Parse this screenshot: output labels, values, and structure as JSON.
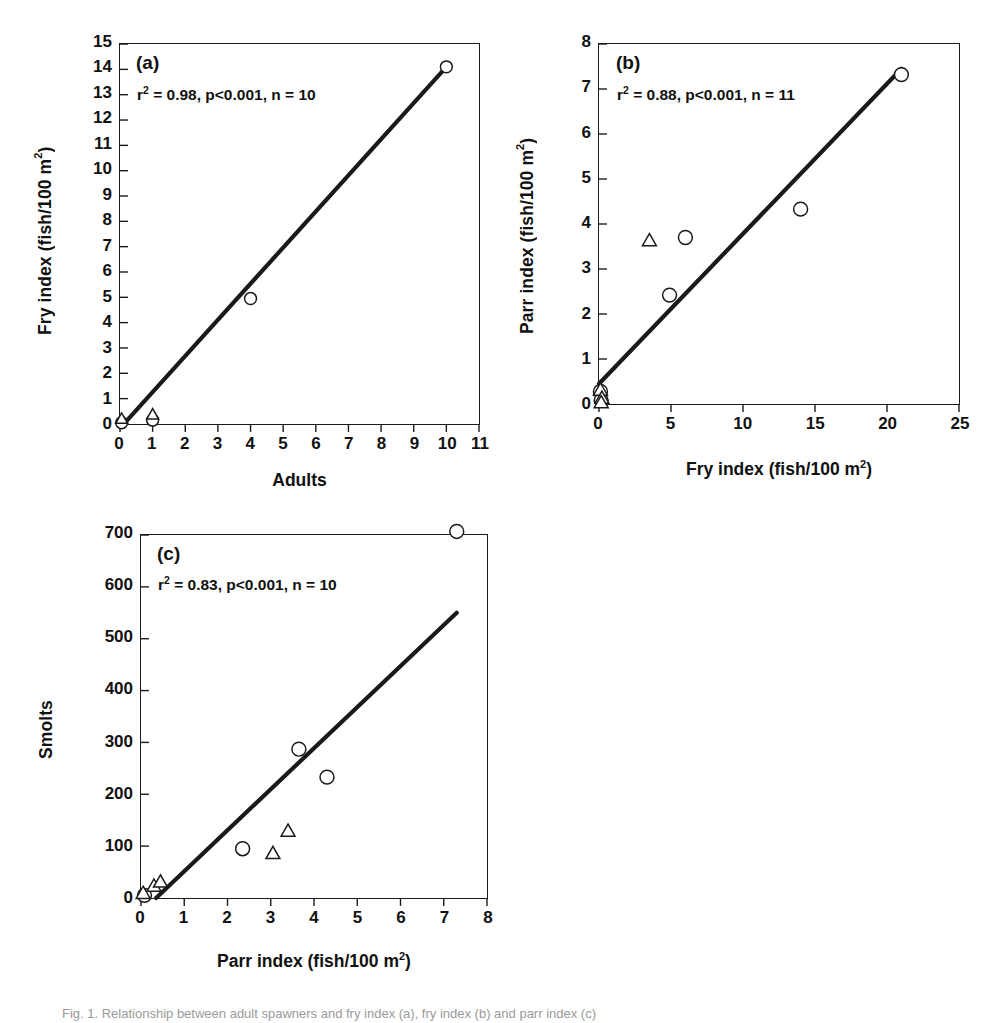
{
  "figure": {
    "background": "#ffffff",
    "ink": "#1a1a1a",
    "caption_fragment": "Fig. 1. Relationship between adult spawners and fry index (a), fry index (b) and parr index (c)"
  },
  "chart_data": [
    {
      "id": "panel-a",
      "type": "scatter",
      "panel_label": "(a)",
      "annotation": "r² = 0.98, p<0.001, n = 10",
      "stats": {
        "r2": 0.98,
        "p": "p<0.001",
        "n": 10
      },
      "xlabel": "Adults",
      "ylabel": "Fry index (fish/100 m²)",
      "xlim": [
        0,
        11
      ],
      "ylim": [
        0,
        15
      ],
      "xticks": [
        0,
        1,
        2,
        3,
        4,
        5,
        6,
        7,
        8,
        9,
        10,
        11
      ],
      "yticks": [
        0,
        1,
        2,
        3,
        4,
        5,
        6,
        7,
        8,
        9,
        10,
        11,
        12,
        13,
        14,
        15
      ],
      "grid": false,
      "legend": null,
      "series": [
        {
          "name": "circles",
          "marker": "open-circle",
          "points": [
            [
              0.05,
              0.05
            ],
            [
              1.0,
              0.15
            ],
            [
              4.0,
              4.95
            ],
            [
              10.0,
              14.1
            ]
          ]
        },
        {
          "name": "triangles",
          "marker": "open-triangle",
          "points": [
            [
              0.05,
              0.18
            ],
            [
              1.0,
              0.35
            ]
          ]
        }
      ],
      "fit_line": {
        "x": [
          0.12,
          10.0
        ],
        "y": [
          0.0,
          14.1
        ]
      }
    },
    {
      "id": "panel-b",
      "type": "scatter",
      "panel_label": "(b)",
      "annotation": "r² = 0.88, p<0.001, n = 11",
      "stats": {
        "r2": 0.88,
        "p": "p<0.001",
        "n": 11
      },
      "xlabel": "Fry index (fish/100 m²)",
      "ylabel": "Parr index (fish/100 m²)",
      "xlim": [
        0,
        25
      ],
      "ylim": [
        0,
        8
      ],
      "xticks": [
        0,
        5,
        10,
        15,
        20,
        25
      ],
      "yticks": [
        0,
        1,
        2,
        3,
        4,
        5,
        6,
        7,
        8
      ],
      "grid": false,
      "legend": null,
      "series": [
        {
          "name": "circles",
          "marker": "open-circle",
          "points": [
            [
              0.1,
              0.28
            ],
            [
              0.15,
              0.08
            ],
            [
              4.9,
              2.42
            ],
            [
              6.0,
              3.7
            ],
            [
              14.0,
              4.33
            ],
            [
              21.0,
              7.32
            ]
          ]
        },
        {
          "name": "triangles",
          "marker": "open-triangle",
          "points": [
            [
              0.1,
              0.3
            ],
            [
              0.2,
              0.12
            ],
            [
              0.15,
              0.02
            ],
            [
              3.5,
              3.62
            ]
          ]
        }
      ],
      "fit_line": {
        "x": [
          0.0,
          21.0
        ],
        "y": [
          0.45,
          7.45
        ]
      }
    },
    {
      "id": "panel-c",
      "type": "scatter",
      "panel_label": "(c)",
      "annotation": "r² = 0.83, p<0.001, n = 10",
      "stats": {
        "r2": 0.83,
        "p": "p<0.001",
        "n": 10
      },
      "xlabel": "Parr index (fish/100 m²)",
      "ylabel": "Smolts",
      "xlim": [
        0,
        8
      ],
      "ylim": [
        0,
        700
      ],
      "xticks": [
        0,
        1,
        2,
        3,
        4,
        5,
        6,
        7,
        8
      ],
      "yticks": [
        0,
        100,
        200,
        300,
        400,
        500,
        600,
        700
      ],
      "grid": false,
      "legend": null,
      "series": [
        {
          "name": "circles",
          "marker": "open-circle",
          "points": [
            [
              0.08,
              5
            ],
            [
              2.35,
              95
            ],
            [
              3.65,
              287
            ],
            [
              4.3,
              233
            ],
            [
              7.3,
              707
            ]
          ]
        },
        {
          "name": "triangles",
          "marker": "open-triangle",
          "points": [
            [
              0.05,
              8
            ],
            [
              0.3,
              22
            ],
            [
              0.45,
              30
            ],
            [
              3.05,
              85
            ],
            [
              3.4,
              128
            ]
          ]
        }
      ],
      "fit_line": {
        "x": [
          0.35,
          7.3
        ],
        "y": [
          0,
          550
        ]
      }
    }
  ]
}
